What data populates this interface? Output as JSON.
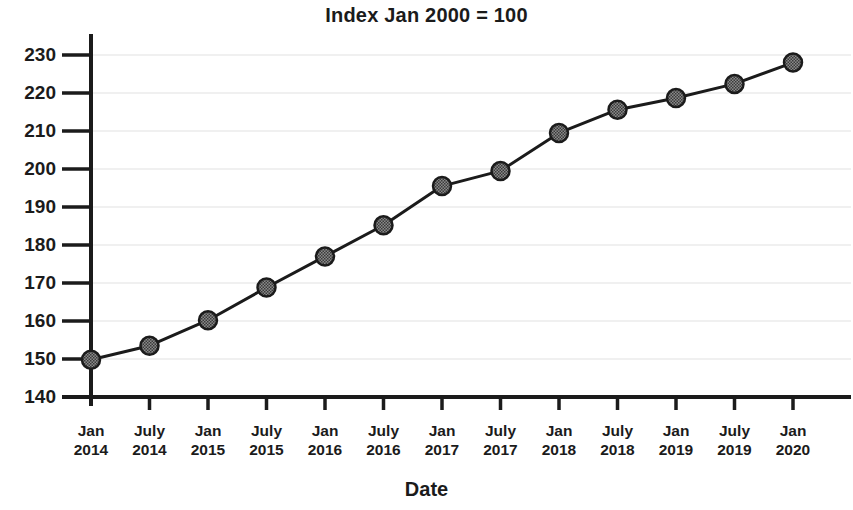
{
  "chart_data": {
    "type": "line",
    "title": "Index Jan 2000 = 100",
    "xlabel": "Date",
    "ylabel": "",
    "categories": [
      "Jan 2014",
      "July 2014",
      "Jan 2015",
      "July 2015",
      "Jan 2016",
      "July 2016",
      "Jan 2017",
      "July 2017",
      "Jan 2018",
      "July 2018",
      "Jan 2019",
      "July 2019",
      "Jan 2020"
    ],
    "category_lines": [
      {
        "month": "Jan",
        "year": "2014"
      },
      {
        "month": "July",
        "year": "2014"
      },
      {
        "month": "Jan",
        "year": "2015"
      },
      {
        "month": "July",
        "year": "2015"
      },
      {
        "month": "Jan",
        "year": "2016"
      },
      {
        "month": "July",
        "year": "2016"
      },
      {
        "month": "Jan",
        "year": "2017"
      },
      {
        "month": "July",
        "year": "2017"
      },
      {
        "month": "Jan",
        "year": "2018"
      },
      {
        "month": "July",
        "year": "2018"
      },
      {
        "month": "Jan",
        "year": "2019"
      },
      {
        "month": "July",
        "year": "2019"
      },
      {
        "month": "Jan",
        "year": "2020"
      }
    ],
    "values": [
      149.8,
      153.5,
      160.2,
      168.8,
      177.0,
      185.2,
      195.5,
      199.5,
      209.5,
      215.6,
      218.7,
      222.4,
      228.0
    ],
    "series": [
      {
        "name": "Index",
        "values": [
          149.8,
          153.5,
          160.2,
          168.8,
          177.0,
          185.2,
          195.5,
          199.5,
          209.5,
          215.6,
          218.7,
          222.4,
          228.0
        ]
      }
    ],
    "ylim": [
      140,
      230
    ],
    "yticks": [
      140,
      150,
      160,
      170,
      180,
      190,
      200,
      210,
      220,
      230
    ],
    "ytick_labels": [
      "140",
      "150",
      "160",
      "170",
      "180",
      "190",
      "200",
      "210",
      "220",
      "230"
    ],
    "grid": true,
    "grid_axis": "y",
    "legend": false,
    "legend_position": "none",
    "colors": {
      "line": "#1b1b1b",
      "marker_fill": "#6e6e6e",
      "marker_edge": "#1b1b1b",
      "axis": "#1b1b1b",
      "grid": "#f0f0f0",
      "background": "#ffffff",
      "text": "#1b1b1b"
    },
    "marker": "circle",
    "marker_size": 9,
    "line_width": 3
  }
}
